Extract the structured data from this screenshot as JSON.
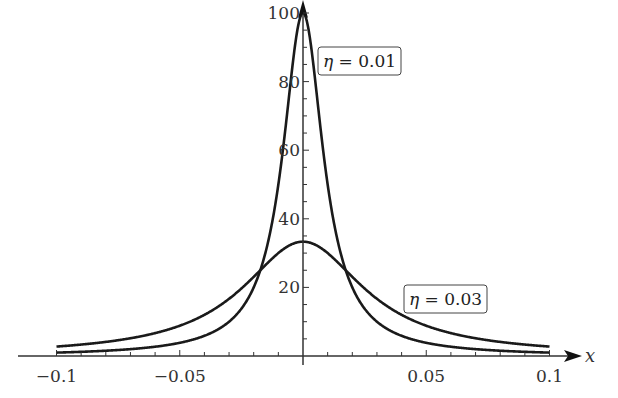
{
  "chart_data": {
    "type": "line",
    "title": "",
    "xlabel": "x",
    "ylabel": "",
    "xlim": [
      -0.1,
      0.1
    ],
    "ylim": [
      0,
      100
    ],
    "grid": false,
    "x_ticks": [
      -0.1,
      -0.05,
      0.05,
      0.1
    ],
    "x_tick_labels": [
      "−0.1",
      "−0.05",
      "0.05",
      "0.1"
    ],
    "y_ticks": [
      20,
      40,
      60,
      80,
      100
    ],
    "y_tick_labels": [
      "20",
      "40",
      "60",
      "80",
      "100"
    ],
    "formula": "eta / (x^2 + eta^2)",
    "series": [
      {
        "name": "η = 0.01",
        "eta": 0.01,
        "peak": 100,
        "x": [
          -0.1,
          -0.05,
          -0.02,
          -0.01,
          -0.005,
          0,
          0.005,
          0.01,
          0.02,
          0.05,
          0.1
        ],
        "values": [
          0.99,
          3.85,
          20,
          50,
          80,
          100,
          80,
          50,
          20,
          3.85,
          0.99
        ]
      },
      {
        "name": "η = 0.03",
        "eta": 0.03,
        "peak": 33.3,
        "x": [
          -0.1,
          -0.05,
          -0.02,
          -0.01,
          0,
          0.01,
          0.02,
          0.05,
          0.1
        ],
        "values": [
          2.75,
          8.82,
          23.1,
          30,
          33.3,
          30,
          23.1,
          8.82,
          2.75
        ]
      }
    ],
    "annotations": [
      {
        "text": "η = 0.01",
        "near": "peak of narrow curve",
        "boxed": true
      },
      {
        "text": "η = 0.03",
        "near": "right tail of wide curve",
        "boxed": true
      }
    ],
    "legend_position": "inline labels"
  },
  "axes": {
    "x_label": "x",
    "x_ticks": [
      "−0.1",
      "−0.05",
      "0.05",
      "0.1"
    ],
    "y_ticks": [
      "20",
      "40",
      "60",
      "80",
      "100"
    ]
  },
  "labels": {
    "narrow": {
      "eta_symbol": "η",
      "rest": " = 0.01"
    },
    "wide": {
      "eta_symbol": "η",
      "rest": " = 0.03"
    }
  },
  "style": {
    "line_color": "#1a1a1a",
    "axis_color": "#333333"
  }
}
